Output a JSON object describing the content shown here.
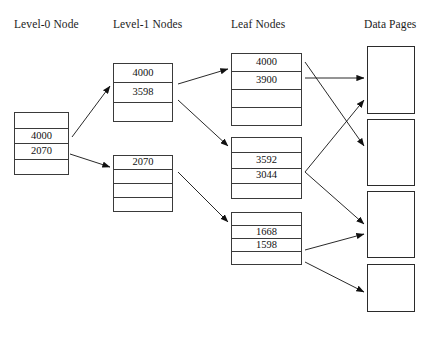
{
  "diagram": {
    "headers": [
      {
        "label": "Level-0 Node",
        "x": 14,
        "y": 18
      },
      {
        "label": "Level-1 Nodes",
        "x": 113,
        "y": 18
      },
      {
        "label": "Leaf Nodes",
        "x": 231,
        "y": 18
      },
      {
        "label": "Data Pages",
        "x": 364,
        "y": 18
      }
    ],
    "colors": {
      "background": "#ffffff",
      "node_border": "#3a3a3a",
      "page_border": "#2b2b2b",
      "text": "#111111",
      "arrow": "#111111"
    },
    "nodes": [
      {
        "name": "level-0-node",
        "x": 14,
        "y": 112,
        "w": 55,
        "h": 63,
        "cells": [
          "",
          "4000",
          "2070",
          ""
        ]
      },
      {
        "name": "level-1-node-upper",
        "x": 113,
        "y": 63,
        "w": 60,
        "h": 59,
        "cells": [
          "4000",
          "3598",
          ""
        ]
      },
      {
        "name": "level-1-node-lower",
        "x": 113,
        "y": 155,
        "w": 60,
        "h": 57,
        "cells": [
          "2070",
          "",
          "",
          ""
        ]
      },
      {
        "name": "leaf-node-1",
        "x": 231,
        "y": 53,
        "w": 71,
        "h": 73,
        "cells": [
          "4000",
          "3900",
          "",
          ""
        ]
      },
      {
        "name": "leaf-node-2",
        "x": 231,
        "y": 137,
        "w": 71,
        "h": 62,
        "cells": [
          "",
          "3592",
          "3044",
          ""
        ]
      },
      {
        "name": "leaf-node-3",
        "x": 231,
        "y": 212,
        "w": 71,
        "h": 53,
        "cells": [
          "",
          "1668",
          "1598",
          ""
        ]
      }
    ],
    "data_pages": [
      {
        "name": "data-page-1",
        "x": 367,
        "y": 46,
        "w": 48,
        "h": 68
      },
      {
        "name": "data-page-2",
        "x": 367,
        "y": 119,
        "w": 48,
        "h": 67
      },
      {
        "name": "data-page-3",
        "x": 367,
        "y": 191,
        "w": 48,
        "h": 67
      },
      {
        "name": "data-page-4",
        "x": 367,
        "y": 264,
        "w": 48,
        "h": 48
      }
    ],
    "edges": [
      {
        "name": "edge-level0-to-level1-upper",
        "x1": 72,
        "y1": 137,
        "x2": 110,
        "y2": 86
      },
      {
        "name": "edge-level0-to-level1-lower",
        "x1": 70,
        "y1": 154,
        "x2": 110,
        "y2": 167
      },
      {
        "name": "edge-level1-upper-to-leaf1",
        "x1": 178,
        "y1": 84,
        "x2": 228,
        "y2": 69
      },
      {
        "name": "edge-level1-upper-to-leaf2",
        "x1": 178,
        "y1": 100,
        "x2": 228,
        "y2": 146
      },
      {
        "name": "edge-level1-lower-to-leaf3",
        "x1": 178,
        "y1": 172,
        "x2": 228,
        "y2": 222
      },
      {
        "name": "edge-leaf1-to-page1",
        "x1": 305,
        "y1": 78,
        "x2": 364,
        "y2": 78
      },
      {
        "name": "edge-leaf1-to-page2",
        "x1": 305,
        "y1": 62,
        "x2": 364,
        "y2": 146
      },
      {
        "name": "edge-leaf2-to-page1",
        "x1": 305,
        "y1": 172,
        "x2": 364,
        "y2": 100
      },
      {
        "name": "edge-leaf2-to-page3",
        "x1": 305,
        "y1": 172,
        "x2": 364,
        "y2": 224
      },
      {
        "name": "edge-leaf3-to-page3",
        "x1": 305,
        "y1": 250,
        "x2": 364,
        "y2": 234
      },
      {
        "name": "edge-leaf3-to-page4",
        "x1": 305,
        "y1": 262,
        "x2": 364,
        "y2": 292
      }
    ]
  }
}
